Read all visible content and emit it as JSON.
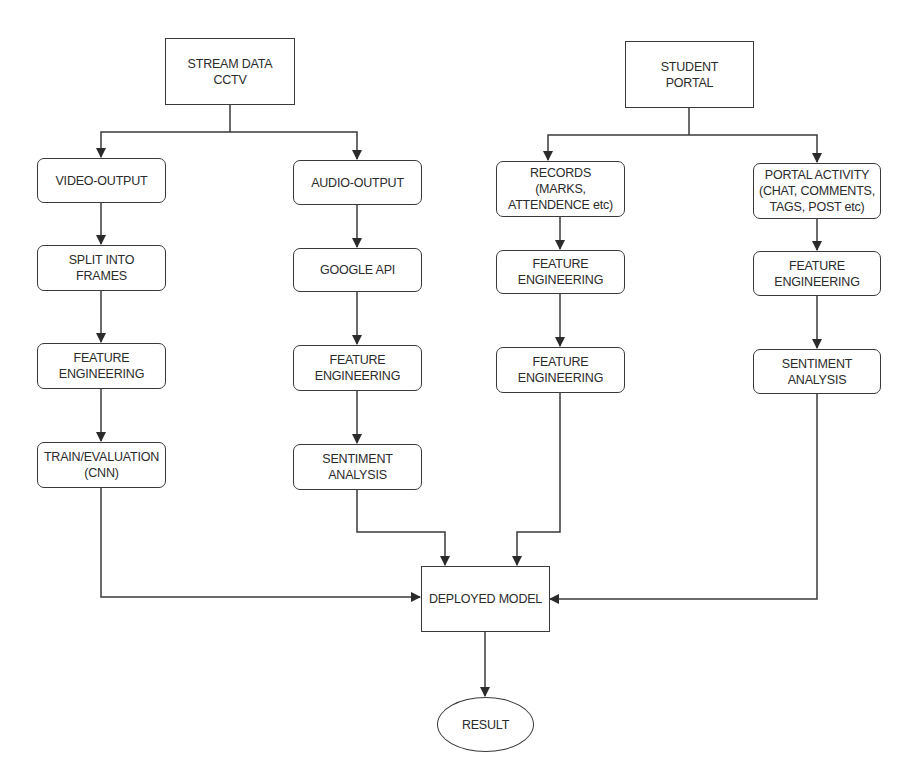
{
  "diagram": {
    "type": "flowchart",
    "colors": {
      "stroke": "#3a3a3a",
      "text": "#2b2b2b",
      "background": "#ffffff"
    },
    "nodes": {
      "stream": {
        "label": "STREAM DATA\nCCTV",
        "shape": "rect"
      },
      "portal": {
        "label": "STUDENT\nPORTAL",
        "shape": "rect"
      },
      "video_output": {
        "label": "VIDEO-OUTPUT",
        "shape": "rounded"
      },
      "split_frames": {
        "label": "SPLIT INTO\nFRAMES",
        "shape": "rounded"
      },
      "video_fe": {
        "label": "FEATURE\nENGINEERING",
        "shape": "rounded"
      },
      "train_eval": {
        "label": "TRAIN/EVALUATION\n(CNN)",
        "shape": "rounded"
      },
      "audio_output": {
        "label": "AUDIO-OUTPUT",
        "shape": "rounded"
      },
      "google_api": {
        "label": "GOOGLE API",
        "shape": "rounded"
      },
      "audio_fe": {
        "label": "FEATURE\nENGINEERING",
        "shape": "rounded"
      },
      "audio_sentiment": {
        "label": "SENTIMENT\nANALYSIS",
        "shape": "rounded"
      },
      "records": {
        "label": "RECORDS\n(MARKS,\nATTENDENCE etc)",
        "shape": "rounded"
      },
      "records_fe1": {
        "label": "FEATURE\nENGINEERING",
        "shape": "rounded"
      },
      "records_fe2": {
        "label": "FEATURE\nENGINEERING",
        "shape": "rounded"
      },
      "portal_activity": {
        "label": "PORTAL ACTIVITY\n(CHAT, COMMENTS,\nTAGS, POST etc)",
        "shape": "rounded"
      },
      "activity_fe": {
        "label": "FEATURE\nENGINEERING",
        "shape": "rounded"
      },
      "activity_sentiment": {
        "label": "SENTIMENT\nANALYSIS",
        "shape": "rounded"
      },
      "deployed_model": {
        "label": "DEPLOYED MODEL",
        "shape": "rect"
      },
      "result": {
        "label": "RESULT",
        "shape": "ellipse"
      }
    },
    "edges": [
      [
        "stream",
        "video_output"
      ],
      [
        "stream",
        "audio_output"
      ],
      [
        "video_output",
        "split_frames"
      ],
      [
        "split_frames",
        "video_fe"
      ],
      [
        "video_fe",
        "train_eval"
      ],
      [
        "audio_output",
        "google_api"
      ],
      [
        "google_api",
        "audio_fe"
      ],
      [
        "audio_fe",
        "audio_sentiment"
      ],
      [
        "portal",
        "records"
      ],
      [
        "portal",
        "portal_activity"
      ],
      [
        "records",
        "records_fe1"
      ],
      [
        "records_fe1",
        "records_fe2"
      ],
      [
        "portal_activity",
        "activity_fe"
      ],
      [
        "activity_fe",
        "activity_sentiment"
      ],
      [
        "train_eval",
        "deployed_model"
      ],
      [
        "audio_sentiment",
        "deployed_model"
      ],
      [
        "records_fe2",
        "deployed_model"
      ],
      [
        "activity_sentiment",
        "deployed_model"
      ],
      [
        "deployed_model",
        "result"
      ]
    ]
  }
}
